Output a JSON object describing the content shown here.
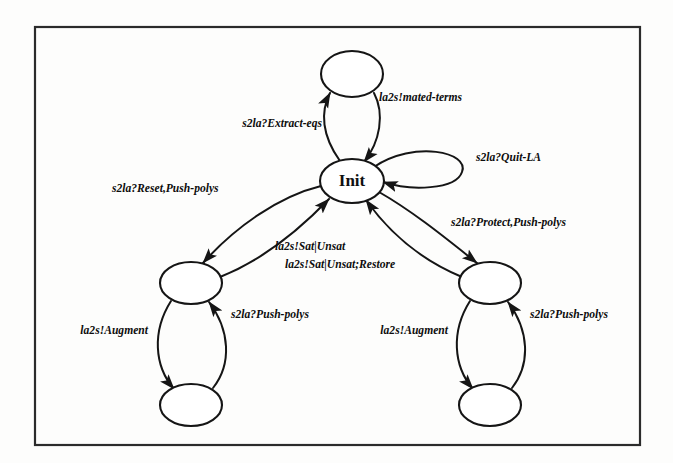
{
  "figure": {
    "kind": "state-transition-diagram",
    "title_visible": false,
    "frame": {
      "x": 35,
      "y": 27,
      "width": 605,
      "height": 418,
      "stroke": "#2b2b2b"
    },
    "canvas": {
      "width": 673,
      "height": 463,
      "background": "#fdfdfc"
    },
    "ink_color": "#151515"
  },
  "nodes": [
    {
      "id": "top",
      "label": "",
      "cx": 352,
      "cy": 74,
      "rx": 31,
      "ry": 23
    },
    {
      "id": "init",
      "label": "Init",
      "cx": 352,
      "cy": 181,
      "rx": 32,
      "ry": 22
    },
    {
      "id": "left_mid",
      "label": "",
      "cx": 191,
      "cy": 283,
      "rx": 31,
      "ry": 21
    },
    {
      "id": "left_bottom",
      "label": "",
      "cx": 191,
      "cy": 405,
      "rx": 31,
      "ry": 21
    },
    {
      "id": "right_mid",
      "label": "",
      "cx": 490,
      "cy": 283,
      "rx": 31,
      "ry": 21
    },
    {
      "id": "right_bottom",
      "label": "",
      "cx": 490,
      "cy": 405,
      "rx": 31,
      "ry": 21
    }
  ],
  "edges": [
    {
      "id": "init-to-top",
      "from": "init",
      "to": "top",
      "label": "s2la?Extract-eqs"
    },
    {
      "id": "top-to-init",
      "from": "top",
      "to": "init",
      "label": "la2s!mated-terms"
    },
    {
      "id": "init-self-loop",
      "from": "init",
      "to": "init",
      "label": "s2la?Quit-LA"
    },
    {
      "id": "init-to-left-mid",
      "from": "init",
      "to": "left_mid",
      "label": "s2la?Reset,Push-polys"
    },
    {
      "id": "left-mid-to-init",
      "from": "left_mid",
      "to": "init",
      "label": "la2s!Sat|Unsat"
    },
    {
      "id": "right-mid-to-init",
      "from": "right_mid",
      "to": "init",
      "label": "la2s!Sat|Unsat;Restore"
    },
    {
      "id": "init-to-right-mid",
      "from": "init",
      "to": "right_mid",
      "label": "s2la?Protect,Push-polys"
    },
    {
      "id": "left-mid-to-bottom",
      "from": "left_mid",
      "to": "left_bottom",
      "label": "la2s!Augment"
    },
    {
      "id": "left-bottom-to-mid",
      "from": "left_bottom",
      "to": "left_mid",
      "label": "s2la?Push-polys"
    },
    {
      "id": "right-mid-to-bottom",
      "from": "right_mid",
      "to": "right_bottom",
      "label": "la2s!Augment"
    },
    {
      "id": "right-bottom-to-mid",
      "from": "right_bottom",
      "to": "right_mid",
      "label": "s2la?Push-polys"
    }
  ],
  "labels": {
    "init_node": "Init",
    "extract_eqs": "s2la?Extract-eqs",
    "mated_terms": "la2s!mated-terms",
    "quit_la": "s2la?Quit-LA",
    "reset_push_polys": "s2la?Reset,Push-polys",
    "sat_unsat": "la2s!Sat|Unsat",
    "sat_unsat_restore": "la2s!Sat|Unsat;Restore",
    "protect_push_polys": "s2la?Protect,Push-polys",
    "augment_left": "la2s!Augment",
    "push_polys_left": "s2la?Push-polys",
    "augment_right": "la2s!Augment",
    "push_polys_right": "s2la?Push-polys"
  }
}
